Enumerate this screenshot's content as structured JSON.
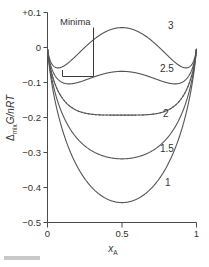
{
  "figure": {
    "title": "",
    "annotation": {
      "label": "Minima"
    }
  },
  "axes": {
    "x": {
      "label_main": "x",
      "label_sub": "A",
      "ticks": [
        "0",
        "0.5",
        "1"
      ],
      "values": [
        0,
        0.5,
        1
      ],
      "range": [
        0,
        1
      ]
    },
    "y": {
      "label_delta": "Δ",
      "label_sub": "mix",
      "label_main": "G/nRT",
      "ticks": [
        "+0.1",
        "0",
        "−0.1",
        "−0.2",
        "−0.3",
        "−0.4",
        "−0.5"
      ],
      "values": [
        0.1,
        0,
        -0.1,
        -0.2,
        -0.3,
        -0.4,
        -0.5
      ],
      "range": [
        -0.5,
        0.1
      ]
    }
  },
  "colors": {
    "curve": "#555555",
    "frame": "#4a4a4a",
    "text": "#333333",
    "background": "#ffffff"
  },
  "curve_labels": [
    {
      "text": "3",
      "x": 168,
      "y": 29
    },
    {
      "text": "2.5",
      "x": 160,
      "y": 72
    },
    {
      "text": "2",
      "x": 163,
      "y": 117
    },
    {
      "text": "1.5",
      "x": 160,
      "y": 152
    },
    {
      "text": "1",
      "x": 165,
      "y": 186
    }
  ],
  "chart_data": {
    "type": "line",
    "title": "",
    "xlabel": "x_A",
    "ylabel": "Δ_mix G/nRT",
    "xlim": [
      0,
      1
    ],
    "ylim": [
      -0.5,
      0.1
    ],
    "grid": false,
    "legend": "inline curve labels at right",
    "x": [
      0.0,
      0.02,
      0.05,
      0.1,
      0.15,
      0.2,
      0.25,
      0.3,
      0.35,
      0.4,
      0.45,
      0.5,
      0.55,
      0.6,
      0.65,
      0.7,
      0.75,
      0.8,
      0.85,
      0.9,
      0.95,
      0.98,
      1.0
    ],
    "series": [
      {
        "name": "1",
        "label": "1",
        "style": "solid",
        "beta": 1,
        "values": [
          0.0,
          -0.077,
          -0.149,
          -0.2254,
          -0.2786,
          -0.3201,
          -0.3525,
          -0.3771,
          -0.3948,
          -0.4062,
          -0.4121,
          -0.4137,
          -0.4121,
          -0.4062,
          -0.3948,
          -0.3771,
          -0.3525,
          -0.3201,
          -0.2786,
          -0.2254,
          -0.149,
          -0.077,
          0.0
        ]
      },
      {
        "name": "1.5",
        "label": "1.5",
        "style": "solid",
        "beta": 1.5,
        "values": [
          0.0,
          -0.0476,
          -0.0777,
          -0.1004,
          -0.1131,
          -0.1201,
          -0.1213,
          -0.1621,
          -0.2007,
          -0.2262,
          -0.2401,
          -0.2449,
          -0.2401,
          -0.2262,
          -0.2007,
          -0.1621,
          -0.1213,
          -0.1201,
          -0.1131,
          -0.1004,
          -0.0777,
          -0.0476,
          0.0
        ]
      },
      {
        "name": "2",
        "label": "2",
        "style": "solid",
        "beta": 2,
        "values": [
          0.0,
          -0.0378,
          -0.054,
          -0.0554,
          -0.0496,
          -0.0401,
          -0.0275,
          -0.1337,
          -0.1767,
          -0.1942,
          -0.1988,
          -0.1993,
          -0.1988,
          -0.1942,
          -0.1767,
          -0.1337,
          -0.0275,
          -0.0401,
          -0.0496,
          -0.0554,
          -0.054,
          -0.0378,
          0.0
        ]
      },
      {
        "name": "2.5",
        "label": "2.5",
        "style": "solid",
        "beta": 2.5,
        "values": [
          0.0,
          -0.0329,
          -0.0422,
          -0.0329,
          -0.0178,
          -0.0001,
          0.0189,
          -0.0914,
          -0.1232,
          -0.103,
          -0.0966,
          -0.0955,
          -0.0966,
          -0.103,
          -0.1232,
          -0.0914,
          0.0189,
          -0.0001,
          -0.0178,
          -0.0329,
          -0.0422,
          -0.0329,
          0.0
        ]
      },
      {
        "name": "3",
        "label": "3",
        "style": "solid",
        "beta": 3,
        "values": [
          0.0,
          -0.028,
          -0.0304,
          -0.0104,
          0.0141,
          0.0399,
          0.0653,
          0.04,
          0.048,
          0.0553,
          0.0594,
          0.0607,
          0.0594,
          0.0553,
          0.048,
          0.04,
          0.0653,
          0.0399,
          0.0141,
          -0.0104,
          -0.0304,
          -0.028,
          0.0
        ]
      },
      {
        "name": "critical-dotted",
        "label": "",
        "style": "dotted",
        "beta": 2,
        "values": [
          0.0,
          -0.0378,
          -0.054,
          -0.0554,
          -0.0731,
          -0.0969,
          -0.1237,
          -0.151,
          -0.176,
          -0.1965,
          -0.2105,
          -0.216,
          -0.2105,
          -0.1965,
          -0.176,
          -0.151,
          -0.1237,
          -0.0969,
          -0.0731,
          -0.0554,
          -0.054,
          -0.0378,
          0.0
        ]
      }
    ]
  }
}
